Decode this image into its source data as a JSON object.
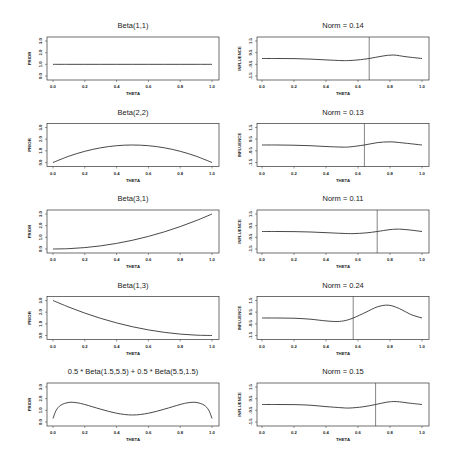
{
  "figure": {
    "width": 450,
    "height": 463,
    "line_color": "#333333",
    "background": "#ffffff"
  },
  "chart_data": [
    {
      "type": "line",
      "panel": "row1-left",
      "title": "Beta(1,1)",
      "xlabel": "THETA",
      "ylabel": "PRIOR",
      "xlim": [
        0,
        1
      ],
      "ylim": [
        0,
        3
      ],
      "xticks": [
        "0.0",
        "0.2",
        "0.4",
        "0.6",
        "0.8",
        "1.0"
      ],
      "yticks": [
        "0.0",
        "1.0",
        "2.0",
        "3.0"
      ],
      "x": [
        0,
        0.1,
        0.2,
        0.3,
        0.4,
        0.5,
        0.6,
        0.7,
        0.8,
        0.9,
        1.0
      ],
      "y": [
        1,
        1,
        1,
        1,
        1,
        1,
        1,
        1,
        1,
        1,
        1
      ]
    },
    {
      "type": "line",
      "panel": "row1-right",
      "title": "Norm = 0.14",
      "xlabel": "THETA",
      "ylabel": "INFLUENCE",
      "xlim": [
        0,
        1
      ],
      "ylim": [
        -1.5,
        1.5
      ],
      "xticks": [
        "0.0",
        "0.2",
        "0.4",
        "0.6",
        "0.8",
        "1.0"
      ],
      "yticks": [
        "-1.5",
        "-0.5",
        "0.5",
        "1.5"
      ],
      "vline": 0.67,
      "x": [
        0,
        0.1,
        0.2,
        0.3,
        0.4,
        0.5,
        0.55,
        0.6,
        0.67,
        0.75,
        0.82,
        0.9,
        1.0
      ],
      "y": [
        0,
        0,
        -0.01,
        -0.05,
        -0.12,
        -0.18,
        -0.17,
        -0.12,
        0.0,
        0.2,
        0.3,
        0.15,
        0.0
      ]
    },
    {
      "type": "line",
      "panel": "row2-left",
      "title": "Beta(2,2)",
      "xlabel": "THETA",
      "ylabel": "PRIOR",
      "xlim": [
        0,
        1
      ],
      "ylim": [
        0,
        3
      ],
      "xticks": [
        "0.0",
        "0.2",
        "0.4",
        "0.6",
        "0.8",
        "1.0"
      ],
      "yticks": [
        "0.0",
        "1.0",
        "2.0",
        "3.0"
      ],
      "x": [
        0,
        0.1,
        0.2,
        0.3,
        0.4,
        0.5,
        0.6,
        0.7,
        0.8,
        0.9,
        1.0
      ],
      "y": [
        0,
        0.54,
        0.96,
        1.26,
        1.44,
        1.5,
        1.44,
        1.26,
        0.96,
        0.54,
        0
      ]
    },
    {
      "type": "line",
      "panel": "row2-right",
      "title": "Norm = 0.13",
      "xlabel": "THETA",
      "ylabel": "INFLUENCE",
      "xlim": [
        0,
        1
      ],
      "ylim": [
        -1.5,
        1.5
      ],
      "xticks": [
        "0.0",
        "0.2",
        "0.4",
        "0.6",
        "0.8",
        "1.0"
      ],
      "yticks": [
        "-1.5",
        "-0.5",
        "0.5",
        "1.5"
      ],
      "vline": 0.64,
      "x": [
        0,
        0.1,
        0.2,
        0.3,
        0.4,
        0.5,
        0.55,
        0.64,
        0.72,
        0.8,
        0.88,
        1.0
      ],
      "y": [
        0,
        0,
        -0.02,
        -0.06,
        -0.13,
        -0.18,
        -0.16,
        0.0,
        0.2,
        0.27,
        0.18,
        0.0
      ]
    },
    {
      "type": "line",
      "panel": "row3-left",
      "title": "Beta(3,1)",
      "xlabel": "THETA",
      "ylabel": "PRIOR",
      "xlim": [
        0,
        1
      ],
      "ylim": [
        0,
        3
      ],
      "xticks": [
        "0.0",
        "0.2",
        "0.4",
        "0.6",
        "0.8",
        "1.0"
      ],
      "yticks": [
        "0.0",
        "1.0",
        "2.0",
        "3.0"
      ],
      "x": [
        0,
        0.1,
        0.2,
        0.3,
        0.4,
        0.5,
        0.6,
        0.7,
        0.8,
        0.9,
        1.0
      ],
      "y": [
        0,
        0.03,
        0.12,
        0.27,
        0.48,
        0.75,
        1.08,
        1.47,
        1.92,
        2.43,
        3.0
      ]
    },
    {
      "type": "line",
      "panel": "row3-right",
      "title": "Norm = 0.11",
      "xlabel": "THETA",
      "ylabel": "INFLUENCE",
      "xlim": [
        0,
        1
      ],
      "ylim": [
        -1.5,
        1.5
      ],
      "xticks": [
        "0.0",
        "0.2",
        "0.4",
        "0.6",
        "0.8",
        "1.0"
      ],
      "yticks": [
        "-1.5",
        "-0.5",
        "0.5",
        "1.5"
      ],
      "vline": 0.72,
      "x": [
        0,
        0.1,
        0.2,
        0.3,
        0.4,
        0.5,
        0.57,
        0.65,
        0.72,
        0.8,
        0.86,
        0.93,
        1.0
      ],
      "y": [
        0,
        0,
        -0.01,
        -0.04,
        -0.1,
        -0.16,
        -0.18,
        -0.12,
        0.0,
        0.16,
        0.2,
        0.12,
        0.0
      ]
    },
    {
      "type": "line",
      "panel": "row4-left",
      "title": "Beta(1,3)",
      "xlabel": "THETA",
      "ylabel": "PRIOR",
      "xlim": [
        0,
        1
      ],
      "ylim": [
        0,
        3
      ],
      "xticks": [
        "0.0",
        "0.2",
        "0.4",
        "0.6",
        "0.8",
        "1.0"
      ],
      "yticks": [
        "0.0",
        "1.0",
        "2.0",
        "3.0"
      ],
      "x": [
        0,
        0.1,
        0.2,
        0.3,
        0.4,
        0.5,
        0.6,
        0.7,
        0.8,
        0.9,
        1.0
      ],
      "y": [
        3.0,
        2.43,
        1.92,
        1.47,
        1.08,
        0.75,
        0.48,
        0.27,
        0.12,
        0.03,
        0
      ]
    },
    {
      "type": "line",
      "panel": "row4-right",
      "title": "Norm = 0.24",
      "xlabel": "THETA",
      "ylabel": "INFLUENCE",
      "xlim": [
        0,
        1
      ],
      "ylim": [
        -1.5,
        1.5
      ],
      "xticks": [
        "0.0",
        "0.2",
        "0.4",
        "0.6",
        "0.8",
        "1.0"
      ],
      "yticks": [
        "-1.5",
        "-0.5",
        "0.5",
        "1.5"
      ],
      "vline": 0.57,
      "x": [
        0,
        0.1,
        0.2,
        0.3,
        0.4,
        0.47,
        0.52,
        0.57,
        0.65,
        0.72,
        0.79,
        0.86,
        0.93,
        1.0
      ],
      "y": [
        0,
        0,
        -0.02,
        -0.1,
        -0.25,
        -0.3,
        -0.22,
        0.0,
        0.5,
        0.95,
        1.1,
        0.8,
        0.3,
        0.0
      ]
    },
    {
      "type": "line",
      "panel": "row5-left",
      "title": "0.5 * Beta(1.5,5.5) + 0.5 * Beta(5.5,1.5)",
      "xlabel": "THETA",
      "ylabel": "PRIOR",
      "xlim": [
        0,
        1
      ],
      "ylim": [
        0,
        3
      ],
      "xticks": [
        "0.0",
        "0.2",
        "0.4",
        "0.6",
        "0.8",
        "1.0"
      ],
      "yticks": [
        "0.0",
        "1.0",
        "2.0",
        "3.0"
      ],
      "x": [
        0,
        0.02,
        0.05,
        0.1,
        0.15,
        0.2,
        0.3,
        0.4,
        0.5,
        0.6,
        0.7,
        0.8,
        0.85,
        0.9,
        0.95,
        0.98,
        1.0
      ],
      "y": [
        0.3,
        1.0,
        1.45,
        1.68,
        1.65,
        1.5,
        1.1,
        0.75,
        0.6,
        0.75,
        1.1,
        1.5,
        1.65,
        1.68,
        1.45,
        1.0,
        0.3
      ]
    },
    {
      "type": "line",
      "panel": "row5-right",
      "title": "Norm = 0.15",
      "xlabel": "THETA",
      "ylabel": "INFLUENCE",
      "xlim": [
        0,
        1
      ],
      "ylim": [
        -1.5,
        1.5
      ],
      "xticks": [
        "0.0",
        "0.2",
        "0.4",
        "0.6",
        "0.8",
        "1.0"
      ],
      "yticks": [
        "-1.5",
        "-0.5",
        "0.5",
        "1.5"
      ],
      "vline": 0.71,
      "x": [
        0,
        0.1,
        0.2,
        0.3,
        0.4,
        0.5,
        0.55,
        0.63,
        0.71,
        0.78,
        0.84,
        0.92,
        1.0
      ],
      "y": [
        0,
        0,
        -0.01,
        -0.06,
        -0.18,
        -0.28,
        -0.3,
        -0.2,
        0.0,
        0.2,
        0.25,
        0.12,
        0.0
      ]
    }
  ]
}
